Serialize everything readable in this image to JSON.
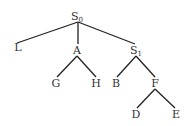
{
  "diagram": {
    "type": "tree",
    "line_color": "#222222",
    "text_color": "#333333",
    "nodes": {
      "root": {
        "label": "S",
        "subscript": "0",
        "x": 78,
        "y": 20
      },
      "L": {
        "label": "L",
        "x": 18,
        "y": 51
      },
      "A": {
        "label": "A",
        "x": 77,
        "y": 54
      },
      "S1": {
        "label": "S",
        "subscript": "1",
        "x": 136,
        "y": 54
      },
      "G": {
        "label": "G",
        "x": 56,
        "y": 87
      },
      "H": {
        "label": "H",
        "x": 96,
        "y": 87
      },
      "B": {
        "label": "B",
        "x": 116,
        "y": 87
      },
      "F": {
        "label": "F",
        "x": 155,
        "y": 87
      },
      "D": {
        "label": "D",
        "x": 136,
        "y": 118
      },
      "E": {
        "label": "E",
        "x": 176,
        "y": 118
      }
    },
    "edges": [
      {
        "from": "root",
        "to": "L"
      },
      {
        "from": "root",
        "to": "A"
      },
      {
        "from": "root",
        "to": "S1"
      },
      {
        "from": "A",
        "to": "G"
      },
      {
        "from": "A",
        "to": "H"
      },
      {
        "from": "S1",
        "to": "B"
      },
      {
        "from": "S1",
        "to": "F"
      },
      {
        "from": "F",
        "to": "D"
      },
      {
        "from": "F",
        "to": "E"
      }
    ]
  }
}
